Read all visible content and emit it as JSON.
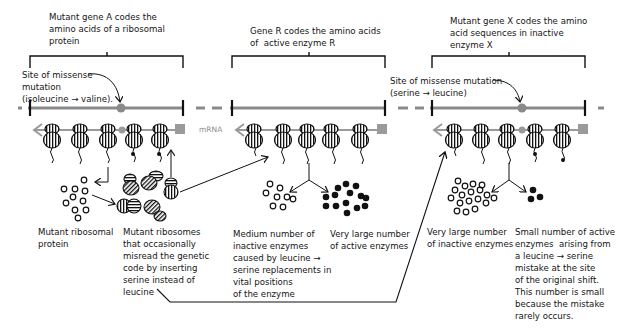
{
  "colors": {
    "gene_line": "#8a8a8a",
    "mutation_site": "#8a8a8a",
    "ink": "#111111",
    "background": "#ffffff"
  },
  "panels": [
    {
      "id": "gene-a",
      "gene_label": "Mutant gene A codes the\namino acids of a ribosomal\nprotein",
      "mutation_label": "Site of missense\nmutation\n(isoleucine → valine).",
      "mrna_label": "mRNA",
      "outputs": [
        {
          "caption": "Mutant ribosomal\nprotein",
          "kind": "open-circles"
        },
        {
          "caption": "Mutant ribosomes\nthat occasionally\nmisread the genetic\ncode by inserting\nserine instead of\nleucine",
          "kind": "mutant-ribosomes"
        }
      ]
    },
    {
      "id": "gene-r",
      "gene_label": "Gene R codes the amino acids\nof  active enzyme R",
      "mrna_label": "mRNA",
      "outputs": [
        {
          "caption": "Medium number of\ninactive enzymes\ncaused by leucine →\nserine replacements in\nvital positions\nof the enzyme",
          "kind": "open-circles"
        },
        {
          "caption": "Very large number\nof active enzymes",
          "kind": "filled-circles"
        }
      ]
    },
    {
      "id": "gene-x",
      "gene_label": "Mutant gene X codes the amino\nacid sequences in inactive\nenzyme X",
      "mutation_label": "Site of missense mutation\n(serine → leucine)",
      "outputs": [
        {
          "caption": "Very large number\nof inactive enzymes",
          "kind": "open-circles"
        },
        {
          "caption": "Small number of active\nenzymes  arising from\na leucine → serine\nmistake at the site\nof the original shift.\nThis number is small\nbecause the mistake\nrarely occurs.",
          "kind": "filled-circles"
        }
      ]
    }
  ]
}
